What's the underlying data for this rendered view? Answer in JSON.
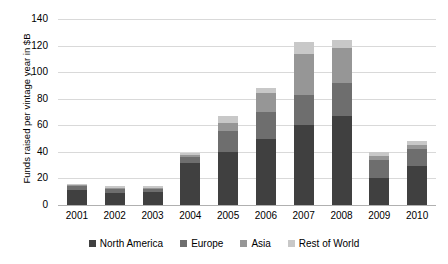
{
  "chart_data": {
    "type": "bar",
    "subtype": "stacked-column",
    "title": "",
    "subtitle": "",
    "xlabel": "",
    "ylabel": "Funds raised per vintage year in $B",
    "categories": [
      "2001",
      "2002",
      "2003",
      "2004",
      "2005",
      "2006",
      "2007",
      "2008",
      "2009",
      "2010"
    ],
    "ylim": [
      0,
      140
    ],
    "yticks": [
      0,
      20,
      40,
      60,
      80,
      100,
      120,
      140
    ],
    "ytick_labels": [
      "0",
      "20",
      "40",
      "60",
      "80",
      "100",
      "120",
      "140"
    ],
    "grid": "horizontal",
    "legend_position": "bottom",
    "series": [
      {
        "name": "North America",
        "color": "#404040",
        "values": [
          11,
          9,
          10,
          32,
          40,
          50,
          60,
          67,
          20,
          29
        ]
      },
      {
        "name": "Europe",
        "color": "#6e6e6e",
        "values": [
          3,
          3,
          2,
          4,
          16,
          20,
          23,
          25,
          14,
          13
        ]
      },
      {
        "name": "Asia",
        "color": "#969696",
        "values": [
          1,
          1,
          1,
          2,
          6,
          14,
          31,
          26,
          3,
          3
        ]
      },
      {
        "name": "Rest of World",
        "color": "#c8c8c8",
        "values": [
          1,
          1,
          1,
          1,
          5,
          4,
          9,
          6,
          3,
          3
        ]
      }
    ],
    "totals": [
      16,
      14,
      14,
      39,
      67,
      88,
      123,
      124,
      40,
      48
    ]
  },
  "legend": {
    "items": [
      {
        "label": "North America",
        "color": "#404040"
      },
      {
        "label": "Europe",
        "color": "#6e6e6e"
      },
      {
        "label": "Asia",
        "color": "#969696"
      },
      {
        "label": "Rest of World",
        "color": "#c8c8c8"
      }
    ]
  }
}
